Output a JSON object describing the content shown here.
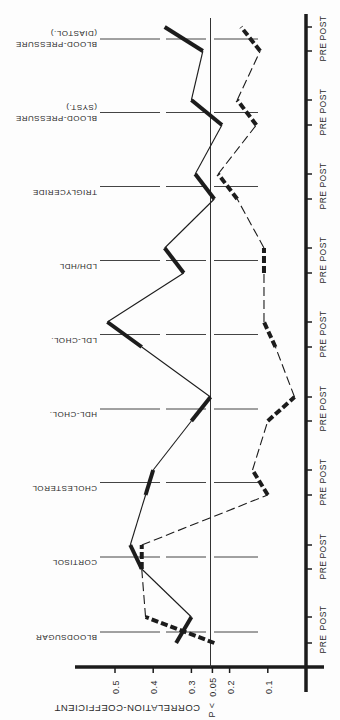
{
  "chart_data": {
    "type": "line",
    "orientation": "rotated-180",
    "title": "",
    "ylabel": "CORRELATION-COEFFICIENT",
    "significance_label": "P < 0.05",
    "significance_value": 0.25,
    "axis_ticks": [
      {
        "label": "0.5",
        "value": 0.5
      },
      {
        "label": "0.4",
        "value": 0.4
      },
      {
        "label": "0.3",
        "value": 0.3
      },
      {
        "label": "0.05",
        "value": 0.245
      },
      {
        "label": "0.2",
        "value": 0.2
      },
      {
        "label": "0.1",
        "value": 0.1
      }
    ],
    "ylim": [
      0,
      0.6
    ],
    "sub_categories": [
      "PRE",
      "POST"
    ],
    "categories": [
      "BLOODSUGAR",
      "CORTISOL",
      "CHOLESTEROL",
      "HDL-CHOL.",
      "LDL-CHOL.",
      "LDH/HDL",
      "TRIGLYCERIDE",
      "BLOOD-PRESSURE (SYST.)",
      "BLOOD-PRESSURE (DIASTOL.)"
    ],
    "category_labels": [
      [
        "BLOODSUGAR"
      ],
      [
        "CORTISOL"
      ],
      [
        "CHOLESTEROL"
      ],
      [
        "HDL-CHOL."
      ],
      [
        "LDL-CHOL."
      ],
      [
        "LDH/HDL"
      ],
      [
        "TRIGLYCERIDE"
      ],
      [
        "BLOOD-PRESSURE",
        "(SYST.)"
      ],
      [
        "BLOOD-PRESSURE",
        "(DIASTOL.)"
      ]
    ],
    "series": [
      {
        "name": "solid",
        "style": "solid",
        "values": [
          [
            0.34,
            0.3
          ],
          [
            0.43,
            0.46
          ],
          [
            0.42,
            0.4
          ],
          [
            0.3,
            0.25
          ],
          [
            0.43,
            0.52
          ],
          [
            0.32,
            0.37
          ],
          [
            0.24,
            0.29
          ],
          [
            0.22,
            0.3
          ],
          [
            0.27,
            0.37
          ]
        ]
      },
      {
        "name": "dashed",
        "style": "dashed",
        "values": [
          [
            0.24,
            0.42
          ],
          [
            0.43,
            0.43
          ],
          [
            0.1,
            0.14
          ],
          [
            0.1,
            0.03
          ],
          [
            0.08,
            0.11
          ],
          [
            0.11,
            0.11
          ],
          [
            0.18,
            0.23
          ],
          [
            0.13,
            0.18
          ],
          [
            0.12,
            0.17
          ]
        ]
      }
    ],
    "grid": false,
    "legend": null
  },
  "layout": {
    "axis_x0": 306,
    "px_per_unit": 382,
    "axis_y": 667,
    "group_pre_y": [
      643,
      569,
      495,
      421,
      347,
      273,
      199,
      125,
      51
    ],
    "group_post_y": [
      617,
      545,
      470,
      397,
      322,
      248,
      174,
      100,
      27
    ],
    "ink": "#1c1c1c"
  }
}
